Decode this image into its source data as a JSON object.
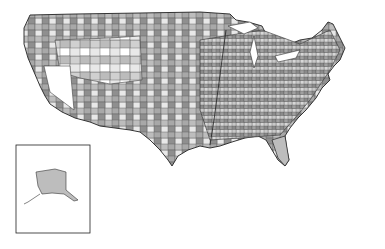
{
  "map": {
    "type": "choropleth",
    "region": "United States (contiguous) with Alaska inset",
    "color_scheme": [
      "#ffffff",
      "#d9d9d9",
      "#b5b5b5",
      "#8c8c8c",
      "#5a5a5a"
    ],
    "border_color": "#333333",
    "inset": {
      "label": "",
      "region": "Alaska"
    }
  }
}
